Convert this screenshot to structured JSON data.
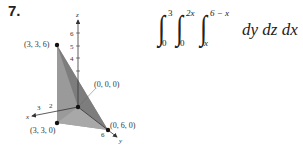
{
  "problem": {
    "number": "7."
  },
  "figure": {
    "axes": {
      "x_label": "x",
      "y_label": "y",
      "z_label": "z",
      "z_ticks": [
        "6",
        "5",
        "4"
      ],
      "x_ticks": [
        "3",
        "2"
      ],
      "y_ticks": [
        "6"
      ]
    },
    "points": [
      {
        "label": "(3, 3, 6)"
      },
      {
        "label": "(0, 0, 0)"
      },
      {
        "label": "(3, 3, 0)"
      },
      {
        "label": "(0, 6, 0)"
      }
    ],
    "fill_color": "#8a8a8a"
  },
  "equation": {
    "integral1": {
      "lower": "0",
      "upper": "3"
    },
    "integral2": {
      "lower": "0",
      "upper": "2x"
    },
    "integral3": {
      "lower": "x",
      "upper": "6 − x"
    },
    "integrand": "dy dz dx",
    "result": "= 18"
  }
}
